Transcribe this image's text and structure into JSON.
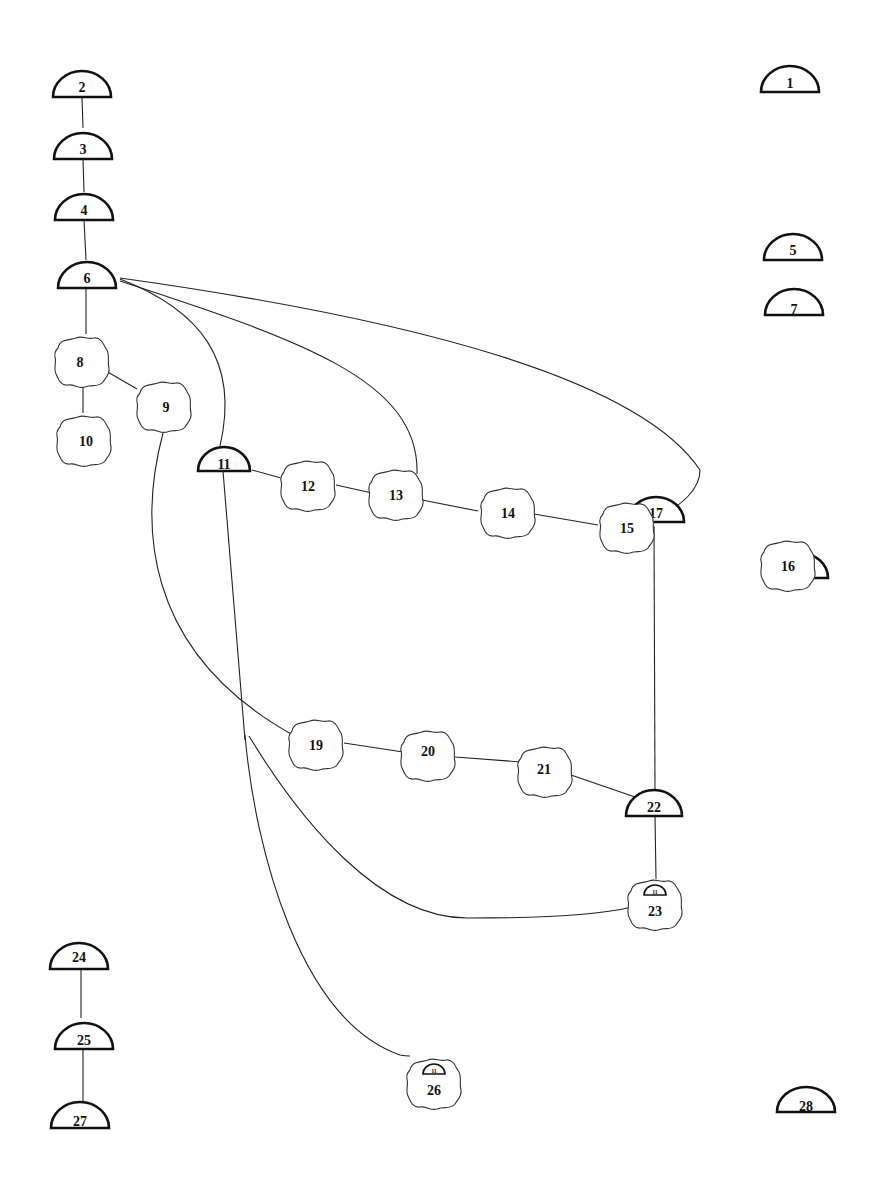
{
  "diagram": {
    "title": "",
    "colors": {
      "ink": "#111111",
      "background": "#ffffff"
    },
    "nodes": [
      {
        "id": "1",
        "type": "half-dome",
        "x": 790,
        "y": 92
      },
      {
        "id": "2",
        "type": "half-dome",
        "x": 82,
        "y": 96
      },
      {
        "id": "3",
        "type": "half-dome",
        "x": 83,
        "y": 158
      },
      {
        "id": "4",
        "type": "half-dome",
        "x": 84,
        "y": 219
      },
      {
        "id": "5",
        "type": "half-dome",
        "x": 793,
        "y": 259
      },
      {
        "id": "6",
        "type": "half-dome",
        "x": 87,
        "y": 287
      },
      {
        "id": "7",
        "type": "half-dome",
        "x": 794,
        "y": 315
      },
      {
        "id": "8",
        "type": "cloud",
        "x": 82,
        "y": 362
      },
      {
        "id": "9",
        "type": "cloud",
        "x": 166,
        "y": 407
      },
      {
        "id": "10",
        "type": "cloud",
        "x": 86,
        "y": 441
      },
      {
        "id": "11",
        "type": "half-dome",
        "x": 224,
        "y": 470
      },
      {
        "id": "12",
        "type": "cloud",
        "x": 308,
        "y": 486
      },
      {
        "id": "13",
        "type": "cloud",
        "x": 396,
        "y": 495
      },
      {
        "id": "14",
        "type": "cloud",
        "x": 508,
        "y": 513
      },
      {
        "id": "15",
        "type": "cloud",
        "x": 627,
        "y": 528
      },
      {
        "id": "16",
        "type": "cloud",
        "x": 788,
        "y": 566
      },
      {
        "id": "17",
        "type": "half-dome",
        "x": 656,
        "y": 522
      },
      {
        "id": "18",
        "type": "half-dome",
        "x": 800,
        "y": 578
      },
      {
        "id": "19",
        "type": "cloud",
        "x": 316,
        "y": 745
      },
      {
        "id": "20",
        "type": "cloud",
        "x": 428,
        "y": 756
      },
      {
        "id": "21",
        "type": "cloud",
        "x": 545,
        "y": 772
      },
      {
        "id": "22",
        "type": "half-dome",
        "x": 654,
        "y": 815
      },
      {
        "id": "23",
        "type": "cloud-with-dome",
        "x": 653,
        "y": 905,
        "inner_label": "11"
      },
      {
        "id": "24",
        "type": "half-dome",
        "x": 79,
        "y": 968
      },
      {
        "id": "25",
        "type": "half-dome",
        "x": 84,
        "y": 1049
      },
      {
        "id": "26",
        "type": "cloud-with-dome",
        "x": 434,
        "y": 1086,
        "inner_label": "11"
      },
      {
        "id": "27",
        "type": "half-dome",
        "x": 80,
        "y": 1128
      },
      {
        "id": "28",
        "type": "half-dome",
        "x": 806,
        "y": 1112
      }
    ],
    "edges": [
      {
        "from": "2",
        "to": "3",
        "style": "straight"
      },
      {
        "from": "3",
        "to": "4",
        "style": "straight"
      },
      {
        "from": "4",
        "to": "6",
        "style": "straight"
      },
      {
        "from": "6",
        "to": "8",
        "style": "straight"
      },
      {
        "from": "8",
        "to": "9",
        "style": "straight"
      },
      {
        "from": "8",
        "to": "10",
        "style": "straight"
      },
      {
        "from": "6",
        "to": "11",
        "style": "curve"
      },
      {
        "from": "6",
        "to": "13",
        "style": "curve"
      },
      {
        "from": "6",
        "to": "17",
        "style": "curve"
      },
      {
        "from": "11",
        "to": "12",
        "style": "straight"
      },
      {
        "from": "12",
        "to": "13",
        "style": "straight"
      },
      {
        "from": "13",
        "to": "14",
        "style": "straight"
      },
      {
        "from": "14",
        "to": "15",
        "style": "straight"
      },
      {
        "from": "9",
        "to": "19",
        "style": "curve"
      },
      {
        "from": "19",
        "to": "20",
        "style": "straight"
      },
      {
        "from": "20",
        "to": "21",
        "style": "straight"
      },
      {
        "from": "21",
        "to": "22",
        "style": "straight"
      },
      {
        "from": "17",
        "to": "22",
        "style": "straight"
      },
      {
        "from": "22",
        "to": "23",
        "style": "straight"
      },
      {
        "from": "11",
        "to": "23",
        "style": "curve"
      },
      {
        "from": "11",
        "to": "26",
        "style": "curve"
      },
      {
        "from": "24",
        "to": "25",
        "style": "straight"
      },
      {
        "from": "25",
        "to": "27",
        "style": "straight"
      }
    ]
  }
}
